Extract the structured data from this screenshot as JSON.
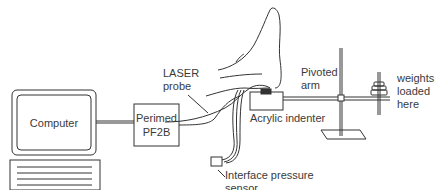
{
  "diagram": {
    "components": {
      "computer": {
        "label": "Computer"
      },
      "perimed": {
        "label_line1": "Perimed",
        "label_line2": "PF2B"
      },
      "laser_probe": {
        "label_line1": "LASER",
        "label_line2": "probe"
      },
      "acrylic_indenter": {
        "label": "Acrylic indenter"
      },
      "pivoted_arm": {
        "label_line1": "Pivoted",
        "label_line2": "arm"
      },
      "weights": {
        "label_line1": "weights",
        "label_line2": "loaded",
        "label_line3": "here"
      },
      "pressure_sensor": {
        "label_line1": "Interface pressure",
        "label_line2": "sensor"
      }
    },
    "colors": {
      "line": "#333333",
      "background": "#ffffff"
    }
  }
}
